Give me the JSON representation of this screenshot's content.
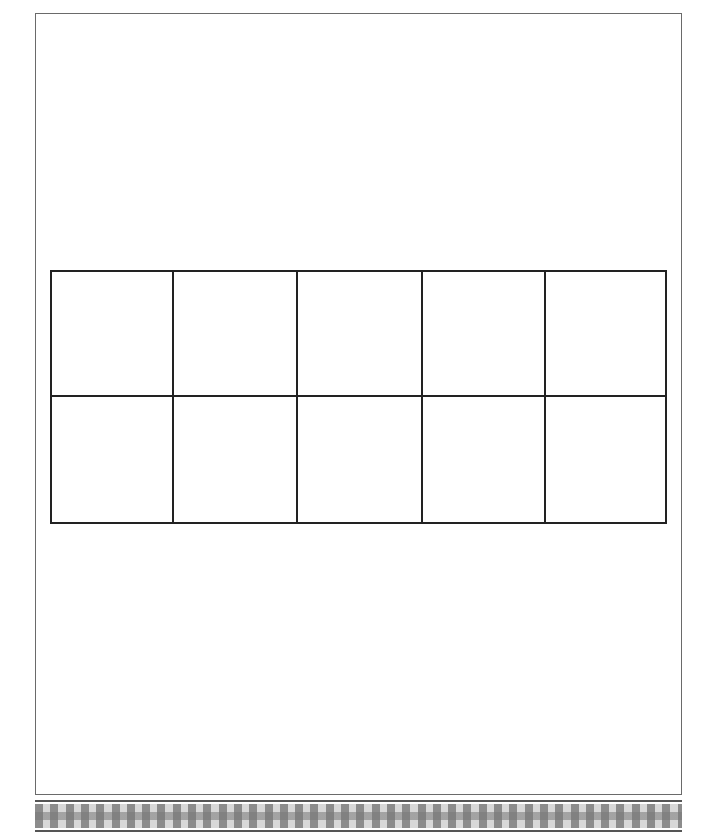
{
  "document": {
    "type": "ten-frame worksheet",
    "grid": {
      "rows": 2,
      "columns": 5,
      "cells": [
        [
          "",
          "",
          "",
          "",
          ""
        ],
        [
          "",
          "",
          "",
          "",
          ""
        ]
      ]
    },
    "colors": {
      "grid_line": "#222222",
      "page_border": "#6a6a6a",
      "checker_dark": "#8c8c8c",
      "checker_light": "#d8d8d8"
    }
  }
}
